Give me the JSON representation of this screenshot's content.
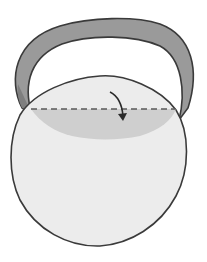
{
  "diagram": {
    "type": "folding-instruction",
    "elements": [
      "band",
      "circle",
      "folded-flap",
      "fold-line",
      "fold-arrow"
    ],
    "colors": {
      "background": "#ffffff",
      "band_fill": "#9a9a9a",
      "band_inner": "#7e7e7e",
      "outline": "#3a3a3a",
      "circle_fill": "#ececec",
      "flap_fill": "#cfcfcf",
      "fold_line": "#5a5a5a",
      "arrow": "#2a2a2a"
    }
  }
}
